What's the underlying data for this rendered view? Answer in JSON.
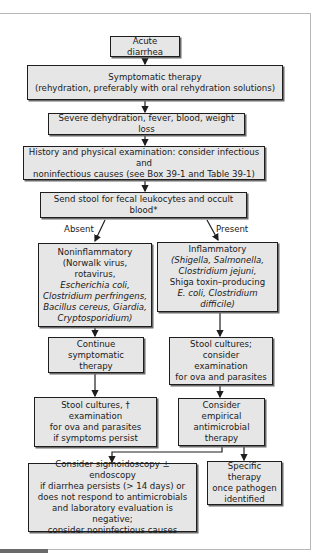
{
  "flowchart": {
    "nodes": {
      "acute": "Acute diarrhea",
      "symptomatic_1": "Symptomatic therapy",
      "symptomatic_2": "(rehydration, preferably with oral rehydration solutions)",
      "severe": "Severe dehydration, fever, blood, weight loss",
      "history_1": "History and physical examination: consider infectious and",
      "history_2": "noninfectious causes (see Box 39-1 and Table 39-1)",
      "send_stool": "Send stool for fecal leukocytes and occult blood*",
      "noninflam": {
        "title": "Noninflammatory",
        "l1": "(Norwalk virus, rotavirus,",
        "l2": "Escherichia coli,",
        "l3": "Clostridium perfringens,",
        "l4": "Bacillus cereus, Giardia,",
        "l5": "Cryptosporidium)"
      },
      "inflam": {
        "title": "Inflammatory",
        "l1": "(Shigella, Salmonella,",
        "l2": "Clostridium jejuni,",
        "l3": "Shiga toxin–producing",
        "l4": "E. coli, Clostridium difficile)"
      },
      "continue_1": "Continue",
      "continue_2": "symptomatic therapy",
      "stool_consider_1": "Stool cultures; consider",
      "stool_consider_2": "examination",
      "stool_consider_3": "for ova and parasites",
      "stool_persist_1": "Stool cultures, † examination",
      "stool_persist_2": "for ova and parasites",
      "stool_persist_3": "if symptoms persist",
      "empirical_1": "Consider empirical",
      "empirical_2": "antimicrobial",
      "empirical_3": "therapy",
      "sigmoid_1": "Consider sigmoidoscopy ± endoscopy",
      "sigmoid_2": "if diarrhea persists (> 14 days) or",
      "sigmoid_3": "does not respond to antimicrobials",
      "sigmoid_4": "and laboratory evaluation is negative;",
      "sigmoid_5": "consider noninfectious causes",
      "specific_1": "Specific therapy",
      "specific_2": "once pathogen",
      "specific_3": "identified"
    },
    "edge_labels": {
      "absent": "Absent",
      "present": "Present"
    },
    "colors": {
      "box_fill": "#e6e6e6",
      "box_border": "#1e1e1e",
      "shadow": "#6a6a6a"
    }
  }
}
